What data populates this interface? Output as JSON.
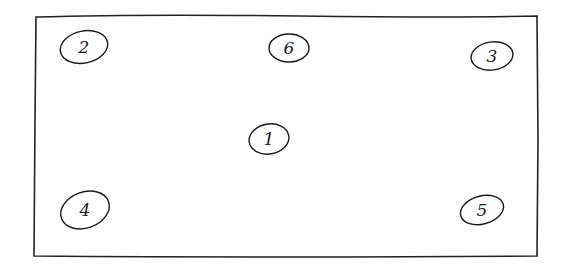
{
  "diagram": {
    "type": "hand-drawn layout sketch",
    "frame": {
      "x": 34,
      "y": 15,
      "width": 504,
      "height": 242
    },
    "nodes": [
      {
        "id": "node-2",
        "label": "2",
        "cx": 84,
        "cy": 47,
        "rx": 24,
        "ry": 16,
        "rot": -12
      },
      {
        "id": "node-6",
        "label": "6",
        "cx": 289,
        "cy": 48,
        "rx": 20,
        "ry": 14,
        "rot": 0
      },
      {
        "id": "node-3",
        "label": "3",
        "cx": 492,
        "cy": 56,
        "rx": 21,
        "ry": 14,
        "rot": -8
      },
      {
        "id": "node-1",
        "label": "1",
        "cx": 269,
        "cy": 139,
        "rx": 20,
        "ry": 15,
        "rot": -10
      },
      {
        "id": "node-4",
        "label": "4",
        "cx": 85,
        "cy": 210,
        "rx": 25,
        "ry": 18,
        "rot": -20
      },
      {
        "id": "node-5",
        "label": "5",
        "cx": 482,
        "cy": 210,
        "rx": 22,
        "ry": 14,
        "rot": -15
      }
    ]
  }
}
